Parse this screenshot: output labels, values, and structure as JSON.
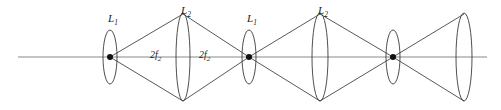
{
  "diagram": {
    "kind": "optical-ray-diagram",
    "background_color": "#ffffff",
    "axis_color": "#8a8a8a",
    "ray_color": "#3a3a3a",
    "lens_color": "#3a3a3a",
    "dot_color": "#111111",
    "optical_axis": {
      "name": "optical-axis",
      "y": 57,
      "x_start": 18,
      "x_end": 487
    },
    "lenses": [
      {
        "id": "lens-1",
        "label": "L",
        "subscript": "1",
        "label_x": 108,
        "label_y": 22,
        "cx": 110,
        "cy": 57,
        "rx": 7,
        "ry": 27,
        "kind": "narrow",
        "has_focal_dot": true,
        "labelled": true
      },
      {
        "id": "lens-2",
        "label": "L",
        "subscript": "2",
        "label_x": 181,
        "label_y": 14,
        "cx": 183,
        "cy": 57,
        "rx": 7,
        "ry": 44,
        "kind": "tall",
        "has_focal_dot": false,
        "labelled": true
      },
      {
        "id": "lens-3",
        "label": "L",
        "subscript": "1",
        "label_x": 247,
        "label_y": 22,
        "cx": 249,
        "cy": 57,
        "rx": 7,
        "ry": 27,
        "kind": "narrow",
        "has_focal_dot": true,
        "labelled": true
      },
      {
        "id": "lens-4",
        "label": "L",
        "subscript": "2",
        "label_x": 318,
        "label_y": 14,
        "cx": 320,
        "cy": 57,
        "rx": 8,
        "ry": 44,
        "kind": "tall",
        "has_focal_dot": false,
        "labelled": true
      },
      {
        "id": "lens-5",
        "label": "",
        "subscript": "",
        "label_x": 0,
        "label_y": 0,
        "cx": 393,
        "cy": 57,
        "rx": 7,
        "ry": 27,
        "kind": "narrow",
        "has_focal_dot": true,
        "labelled": false
      },
      {
        "id": "lens-6",
        "label": "",
        "subscript": "",
        "label_x": 0,
        "label_y": 0,
        "cx": 464,
        "cy": 57,
        "rx": 8,
        "ry": 44,
        "kind": "tall",
        "has_focal_dot": false,
        "labelled": false
      }
    ],
    "focal_dots": [
      {
        "id": "focal-dot-1",
        "cx": 110,
        "cy": 57,
        "r": 3.0
      },
      {
        "id": "focal-dot-2",
        "cx": 249,
        "cy": 57,
        "r": 3.0
      },
      {
        "id": "focal-dot-3",
        "cx": 393,
        "cy": 57,
        "r": 3.0
      }
    ],
    "rays": [
      {
        "id": "ray-1-upper-out",
        "x1": 110,
        "y1": 57,
        "x2": 183,
        "y2": 14
      },
      {
        "id": "ray-1-lower-out",
        "x1": 110,
        "y1": 57,
        "x2": 183,
        "y2": 101
      },
      {
        "id": "ray-2-upper-in",
        "x1": 183,
        "y1": 14,
        "x2": 249,
        "y2": 57
      },
      {
        "id": "ray-2-lower-in",
        "x1": 183,
        "y1": 101,
        "x2": 249,
        "y2": 57
      },
      {
        "id": "ray-3-upper-out",
        "x1": 249,
        "y1": 57,
        "x2": 320,
        "y2": 14
      },
      {
        "id": "ray-3-lower-out",
        "x1": 249,
        "y1": 57,
        "x2": 320,
        "y2": 101
      },
      {
        "id": "ray-4-upper-in",
        "x1": 320,
        "y1": 14,
        "x2": 393,
        "y2": 57
      },
      {
        "id": "ray-4-lower-in",
        "x1": 320,
        "y1": 101,
        "x2": 393,
        "y2": 57
      },
      {
        "id": "ray-5-upper-out",
        "x1": 393,
        "y1": 57,
        "x2": 464,
        "y2": 14
      },
      {
        "id": "ray-5-lower-out",
        "x1": 393,
        "y1": 57,
        "x2": 464,
        "y2": 101
      }
    ],
    "distance_labels": [
      {
        "id": "distance-label-left",
        "text": "2f",
        "subscript": "2",
        "x": 150,
        "y": 58
      },
      {
        "id": "distance-label-right",
        "text": "2f",
        "subscript": "2",
        "x": 199,
        "y": 58
      }
    ]
  }
}
